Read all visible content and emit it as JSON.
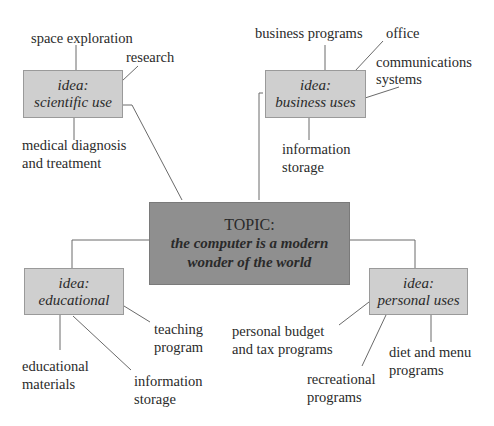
{
  "topic": {
    "heading": "TOPIC:",
    "line1": "the computer is a modern",
    "line2": "wonder of the world"
  },
  "ideas": [
    {
      "prefix": "idea:",
      "name": "scientific use",
      "details": [
        "space exploration",
        "research",
        "medical diagnosis",
        "and treatment"
      ]
    },
    {
      "prefix": "idea:",
      "name": "business uses",
      "details": [
        "business programs",
        "office",
        "communications",
        "systems",
        "information",
        "storage"
      ]
    },
    {
      "prefix": "idea:",
      "name": "educational",
      "details": [
        "teaching",
        "program",
        "educational",
        "materials",
        "information",
        "storage"
      ]
    },
    {
      "prefix": "idea:",
      "name": "personal uses",
      "details": [
        "personal budget",
        "and tax programs",
        "diet and menu",
        "programs",
        "recreational",
        "programs"
      ]
    }
  ],
  "colors": {
    "topic_fill": "#8f8f8f",
    "idea_fill": "#cfcfcf",
    "line": "#6a6a6a"
  }
}
